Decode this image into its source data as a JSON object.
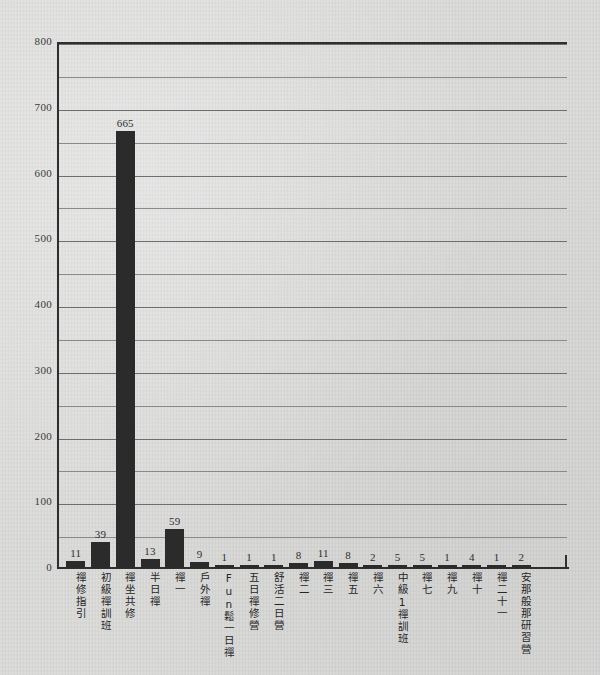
{
  "chart_data": {
    "type": "bar",
    "title": "",
    "subtitle": "",
    "xlabel": "",
    "ylabel": "",
    "ylim": [
      0,
      800
    ],
    "y_ticks": [
      0,
      100,
      200,
      300,
      400,
      500,
      600,
      700,
      800
    ],
    "gridline_interval": 50,
    "grid": true,
    "legend": "none",
    "bar_color": "#2b2b2b",
    "background_color": "#d4d4d3",
    "axis_color": "#2f2f2f",
    "categories": [
      "禪修指引",
      "初級禪訓班",
      "禪坐共修",
      "半日禪",
      "禪一",
      "戶外禪",
      "Fun鬆一日禪",
      "五日禪修營",
      "舒活二日營",
      "禪二",
      "禪三",
      "禪五",
      "禪六",
      "中級1禪訓班",
      "禪七",
      "禪九",
      "禪十",
      "禪二十一",
      "安那般那研習營"
    ],
    "values": [
      11,
      39,
      665,
      13,
      59,
      9,
      1,
      1,
      1,
      8,
      11,
      8,
      2,
      5,
      5,
      1,
      4,
      1,
      2
    ],
    "value_labels": [
      "11",
      "39",
      "665",
      "13",
      "59",
      "9",
      "1",
      "1",
      "1",
      "8",
      "11",
      "8",
      "2",
      "5",
      "5",
      "1",
      "4",
      "1",
      "2"
    ]
  }
}
